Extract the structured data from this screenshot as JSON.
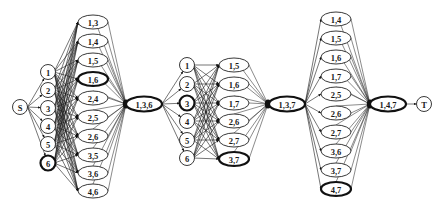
{
  "diagram": {
    "source": {
      "id": "S",
      "label": "S",
      "x": 20,
      "y": 107
    },
    "sink": {
      "id": "T",
      "label": "T",
      "x": 424,
      "y": 104
    },
    "stages": [
      {
        "name": "stage-1",
        "singles": {
          "x": 48,
          "nodes": [
            {
              "label": "1",
              "y": 72,
              "bold": false
            },
            {
              "label": "2",
              "y": 90,
              "bold": false
            },
            {
              "label": "3",
              "y": 108,
              "bold": false
            },
            {
              "label": "4",
              "y": 126,
              "bold": false
            },
            {
              "label": "5",
              "y": 144,
              "bold": false
            },
            {
              "label": "6",
              "y": 163,
              "bold": true
            }
          ]
        },
        "pairs": {
          "x": 93,
          "nodes": [
            {
              "label": "1,3",
              "y": 22,
              "bold": false
            },
            {
              "label": "1,4",
              "y": 41,
              "bold": false
            },
            {
              "label": "1,5",
              "y": 60,
              "bold": false
            },
            {
              "label": "1,6",
              "y": 79,
              "bold": true
            },
            {
              "label": "2,4",
              "y": 98,
              "bold": false
            },
            {
              "label": "2,5",
              "y": 117,
              "bold": false
            },
            {
              "label": "2,6",
              "y": 136,
              "bold": false
            },
            {
              "label": "3,5",
              "y": 155,
              "bold": false
            },
            {
              "label": "3,6",
              "y": 173,
              "bold": false
            },
            {
              "label": "4,6",
              "y": 191,
              "bold": false
            }
          ]
        },
        "junction": {
          "x": 126,
          "y": 104
        },
        "result": {
          "label": "1,3,6",
          "x": 144,
          "y": 104,
          "bold": true
        }
      },
      {
        "name": "stage-2",
        "singles": {
          "x": 187,
          "nodes": [
            {
              "label": "1",
              "y": 65,
              "bold": false
            },
            {
              "label": "2",
              "y": 84,
              "bold": false
            },
            {
              "label": "3",
              "y": 103,
              "bold": true
            },
            {
              "label": "4",
              "y": 121,
              "bold": false
            },
            {
              "label": "5",
              "y": 140,
              "bold": false
            },
            {
              "label": "6",
              "y": 158,
              "bold": false
            }
          ]
        },
        "pairs": {
          "x": 234,
          "nodes": [
            {
              "label": "1,5",
              "y": 65,
              "bold": false
            },
            {
              "label": "1,6",
              "y": 84,
              "bold": false
            },
            {
              "label": "1,7",
              "y": 103,
              "bold": false
            },
            {
              "label": "2,6",
              "y": 121,
              "bold": false
            },
            {
              "label": "2,7",
              "y": 140,
              "bold": false
            },
            {
              "label": "3,7",
              "y": 159,
              "bold": true
            }
          ]
        },
        "junction": {
          "x": 268,
          "y": 104
        },
        "result": {
          "label": "1,3,7",
          "x": 287,
          "y": 104,
          "bold": true
        }
      },
      {
        "name": "stage-3",
        "singles": null,
        "pairs": {
          "x": 336,
          "nodes": [
            {
              "label": "1,4",
              "y": 19,
              "bold": false
            },
            {
              "label": "1,5",
              "y": 38,
              "bold": false
            },
            {
              "label": "1,6",
              "y": 57,
              "bold": false
            },
            {
              "label": "1,7",
              "y": 76,
              "bold": false
            },
            {
              "label": "2,5",
              "y": 94,
              "bold": false
            },
            {
              "label": "2,6",
              "y": 113,
              "bold": false
            },
            {
              "label": "2,7",
              "y": 132,
              "bold": false
            },
            {
              "label": "3,6",
              "y": 151,
              "bold": false
            },
            {
              "label": "3,7",
              "y": 170,
              "bold": false
            },
            {
              "label": "4,7",
              "y": 189,
              "bold": true
            }
          ]
        },
        "junction": {
          "x": 370,
          "y": 104
        },
        "result": {
          "label": "1,4,7",
          "x": 388,
          "y": 104,
          "bold": true
        }
      }
    ]
  }
}
